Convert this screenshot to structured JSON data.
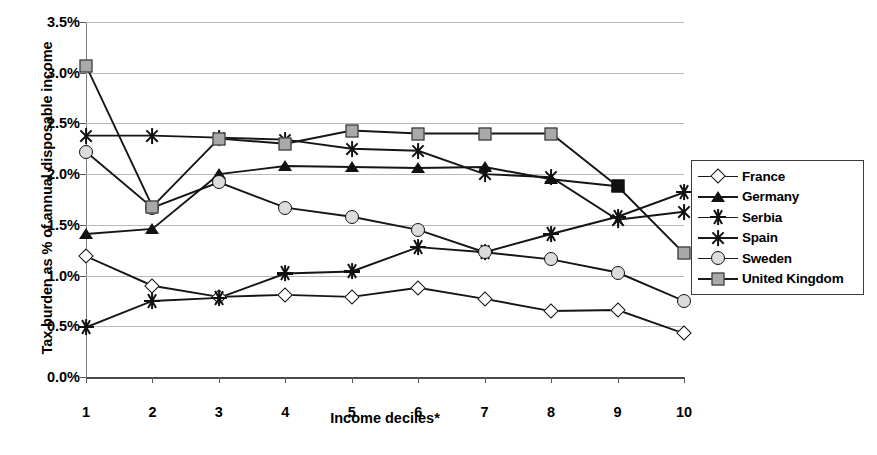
{
  "chart_data": {
    "type": "line",
    "title": "",
    "xlabel": "Income deciles*",
    "ylabel": "Tax burden as % of annual disposable income",
    "x": [
      1,
      2,
      3,
      4,
      5,
      6,
      7,
      8,
      9,
      10
    ],
    "xticklabels": [
      "1",
      "2",
      "3",
      "4",
      "5",
      "6",
      "7",
      "8",
      "9",
      "10"
    ],
    "yticklabels": [
      "0.0%",
      "0.5%",
      "1.0%",
      "1.5%",
      "2.0%",
      "2.5%",
      "3.0%",
      "3.5%"
    ],
    "ytickvalues": [
      0.0,
      0.5,
      1.0,
      1.5,
      2.0,
      2.5,
      3.0,
      3.5
    ],
    "ylim": [
      0.0,
      3.5
    ],
    "xlim": [
      1,
      10
    ],
    "grid": "horizontal",
    "legend_position": "right",
    "series": [
      {
        "name": "France",
        "marker": "open-diamond",
        "color": "#111111",
        "values": [
          1.19,
          0.9,
          0.79,
          0.81,
          0.79,
          0.88,
          0.77,
          0.65,
          0.66,
          0.43
        ]
      },
      {
        "name": "Germany",
        "marker": "filled-triangle",
        "color": "#111111",
        "values": [
          1.41,
          1.46,
          2.0,
          2.08,
          2.07,
          2.06,
          2.07,
          1.95,
          1.88,
          null
        ]
      },
      {
        "name": "Serbia",
        "marker": "asterisk",
        "color": "#111111",
        "values": [
          0.49,
          0.75,
          0.78,
          1.02,
          1.04,
          1.28,
          1.23,
          1.41,
          1.58,
          1.82
        ]
      },
      {
        "name": "Spain",
        "marker": "star-x",
        "color": "#111111",
        "values": [
          2.38,
          2.38,
          2.36,
          2.34,
          2.25,
          2.23,
          2.0,
          1.97,
          1.55,
          1.63
        ]
      },
      {
        "name": "Sweden",
        "marker": "open-circle",
        "color": "#111111",
        "values": [
          2.22,
          1.67,
          1.92,
          1.67,
          1.58,
          1.45,
          1.23,
          1.16,
          1.03,
          0.75
        ]
      },
      {
        "name": "United Kingdom",
        "marker": "gray-square",
        "color": "#a9a9a9",
        "values": [
          3.07,
          1.68,
          2.35,
          2.3,
          2.43,
          2.4,
          2.4,
          2.4,
          1.88,
          1.22
        ]
      }
    ]
  },
  "legend": {
    "items": [
      {
        "label": "France"
      },
      {
        "label": "Germany"
      },
      {
        "label": "Serbia"
      },
      {
        "label": "Spain"
      },
      {
        "label": "Sweden"
      },
      {
        "label": "United Kingdom"
      }
    ]
  }
}
